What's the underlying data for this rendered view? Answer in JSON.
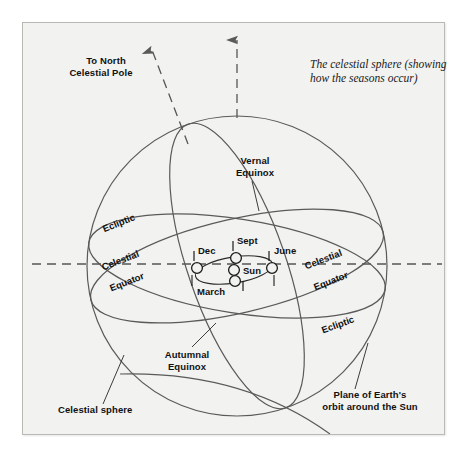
{
  "figure": {
    "type": "astronomy-diagram",
    "caption_line1": "The celestial sphere (showing",
    "caption_line2": "how the seasons occur)",
    "background_color": "#f2f2f0",
    "line_color": "#4a4a4a",
    "text_color": "#101010"
  },
  "labels": {
    "north_pole_line1": "To North",
    "north_pole_line2": "Celestial Pole",
    "vernal_line1": "Vernal",
    "vernal_line2": "Equinox",
    "autumnal_line1": "Autumnal",
    "autumnal_line2": "Equinox",
    "celestial_sphere": "Celestial sphere",
    "plane_line1": "Plane of Earth's",
    "plane_line2": "orbit around the Sun",
    "ecliptic_left": "Ecliptic",
    "ecliptic_right": "Ecliptic",
    "equator_left_line1": "Celestial",
    "equator_left_line2": "Equator",
    "equator_right_line1": "Celestial",
    "equator_right_line2": "Equator"
  },
  "orbit": {
    "sun": "Sun",
    "positions": [
      {
        "name": "Dec",
        "label": "Dec",
        "cx": 197,
        "cy": 268
      },
      {
        "name": "Sept",
        "label": "Sept",
        "cx": 236,
        "cy": 258
      },
      {
        "name": "June",
        "label": "June",
        "cx": 272,
        "cy": 268
      },
      {
        "name": "March",
        "label": "March",
        "cx": 235,
        "cy": 281
      }
    ],
    "sun_center": {
      "cx": 234,
      "cy": 270
    }
  },
  "geometry": {
    "sphere_center_x": 237,
    "sphere_center_y": 266,
    "sphere_radius": 150,
    "ecliptic_tilt_deg": -23.5,
    "equator_tilt_deg": 14
  }
}
